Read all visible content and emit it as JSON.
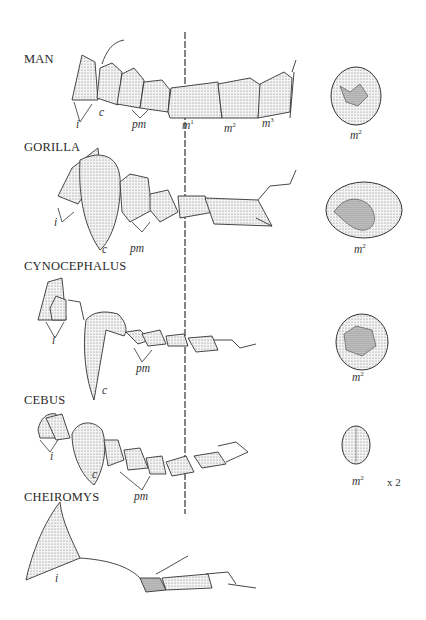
{
  "figure": {
    "midline_marker": "dashed vertical line",
    "rows": [
      {
        "species": "MAN",
        "labels": {
          "incisor": "i",
          "canine": "c",
          "premolar": "pm",
          "molar1": "m",
          "molar1_sup": "1",
          "molar2": "m",
          "molar2_sup": "2",
          "molar3": "m",
          "molar3_sup": "3"
        },
        "crown_view": {
          "label": "m",
          "sup": "2"
        }
      },
      {
        "species": "GORILLA",
        "labels": {
          "incisor": "i",
          "canine": "c",
          "premolar": "pm"
        },
        "crown_view": {
          "label": "m",
          "sup": "2"
        }
      },
      {
        "species": "CYNOCEPHALUS",
        "labels": {
          "incisor": "i",
          "canine": "c",
          "premolar": "pm"
        },
        "crown_view": {
          "label": "m",
          "sup": "2"
        }
      },
      {
        "species": "CEBUS",
        "labels": {
          "incisor": "i",
          "canine": "c",
          "premolar": "pm"
        },
        "crown_view": {
          "label": "m",
          "sup": "2",
          "scale": "x 2"
        }
      },
      {
        "species": "CHEIROMYS",
        "labels": {
          "incisor": "i"
        }
      }
    ]
  }
}
